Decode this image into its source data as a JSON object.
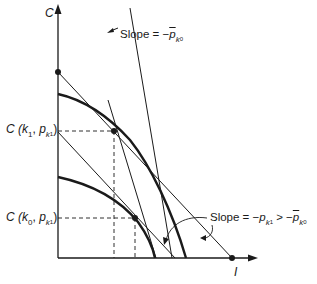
{
  "axes": {
    "y_label": "C",
    "x_label": "I"
  },
  "labels": {
    "c_k1_pk1": {
      "prefix": "C (",
      "k": "k",
      "k_sub": "1",
      "sep": ", ",
      "p": "p",
      "p_sub": "k",
      "p_subsub": "1",
      "suffix": ")"
    },
    "c_k0_pk1": {
      "prefix": "C (",
      "k": "k",
      "k_sub": "0",
      "sep": ", ",
      "p": "p",
      "p_sub": "k",
      "p_subsub": "1",
      "suffix": ")"
    },
    "slope_top": {
      "text": "Slope = −",
      "p": "p",
      "p_sub": "k",
      "p_subsub": "0"
    },
    "slope_bottom": {
      "text": "Slope = −",
      "p1": "p",
      "p1_sub": "k",
      "p1_subsub": "1",
      "relation": " > −",
      "p2": "p",
      "p2_sub": "k",
      "p2_subsub": "0"
    }
  },
  "colors": {
    "ink": "#1a1a1a",
    "background": "#ffffff"
  }
}
